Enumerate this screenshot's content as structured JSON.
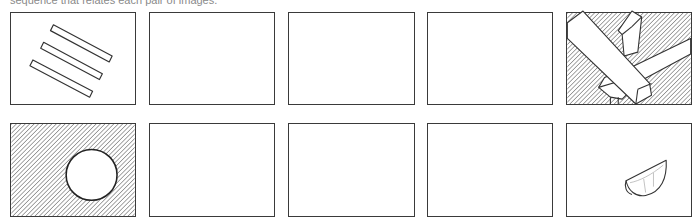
{
  "caption": "sequence that relates each pair of images.",
  "rows": [
    {
      "panels": [
        {
          "position": 1,
          "content": "three-parallel-bars",
          "state": "drawn"
        },
        {
          "position": 2,
          "content": "",
          "state": "empty"
        },
        {
          "position": 3,
          "content": "",
          "state": "empty"
        },
        {
          "position": 4,
          "content": "",
          "state": "empty"
        },
        {
          "position": 5,
          "content": "crossed-lumber-planks-on-hatched-background",
          "state": "drawn"
        }
      ]
    },
    {
      "panels": [
        {
          "position": 1,
          "content": "white-circle-on-hatched-background",
          "state": "drawn"
        },
        {
          "position": 2,
          "content": "",
          "state": "empty"
        },
        {
          "position": 3,
          "content": "",
          "state": "empty"
        },
        {
          "position": 4,
          "content": "",
          "state": "empty"
        },
        {
          "position": 5,
          "content": "orange-wedge-slice",
          "state": "drawn"
        }
      ]
    }
  ],
  "colors": {
    "ink": "#3a3a3a",
    "hatch": "#555555",
    "caption": "#8a8a8a",
    "background": "#ffffff"
  }
}
